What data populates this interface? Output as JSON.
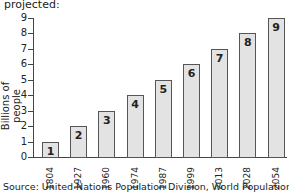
{
  "chart_data": {
    "type": "bar",
    "title": "projected:",
    "xlabel": "",
    "ylabel": "Billions of people",
    "categories": [
      "1804",
      "1927",
      "1960",
      "1974",
      "1987",
      "1999",
      "2013",
      "2028",
      "2054"
    ],
    "values": [
      1,
      2,
      3,
      4,
      5,
      6,
      7,
      8,
      9
    ],
    "bar_labels": [
      "1",
      "2",
      "3",
      "4",
      "5",
      "6",
      "7",
      "8",
      "9"
    ],
    "yticks": [
      0,
      1,
      2,
      3,
      4,
      5,
      6,
      7,
      8,
      9
    ],
    "ylim": [
      0,
      9
    ],
    "grid": false,
    "bar_color": "#e3e3e3",
    "source": "Source: United Nations Population Division, World Population Prospects"
  }
}
